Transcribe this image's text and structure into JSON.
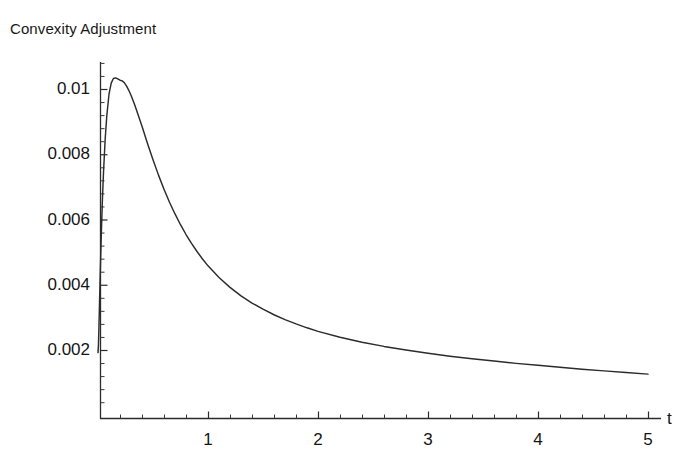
{
  "chart_data": {
    "type": "line",
    "title": "Convexity Adjustment",
    "xlabel": "t",
    "ylabel": "",
    "xlim": [
      0,
      5.1
    ],
    "ylim": [
      0,
      0.0109
    ],
    "grid": false,
    "legend": null,
    "x_ticks": [
      {
        "value": 1,
        "label": "1"
      },
      {
        "value": 2,
        "label": "2"
      },
      {
        "value": 3,
        "label": "3"
      },
      {
        "value": 4,
        "label": "4"
      },
      {
        "value": 5,
        "label": "5"
      }
    ],
    "y_ticks": [
      {
        "value": 0.002,
        "label": "0.002"
      },
      {
        "value": 0.004,
        "label": "0.004"
      },
      {
        "value": 0.006,
        "label": "0.006"
      },
      {
        "value": 0.008,
        "label": "0.008"
      },
      {
        "value": 0.01,
        "label": "0.01"
      }
    ],
    "x_minor_tick_step": 0.2,
    "y_minor_tick_step": 0.0004,
    "series": [
      {
        "name": "Convexity Adjustment",
        "color": "#2b2b2b",
        "x": [
          0.0,
          0.004,
          0.008,
          0.012,
          0.018,
          0.024,
          0.03,
          0.04,
          0.05,
          0.065,
          0.08,
          0.1,
          0.12,
          0.14,
          0.16,
          0.18,
          0.2,
          0.22,
          0.24,
          0.26,
          0.28,
          0.3,
          0.33,
          0.36,
          0.4,
          0.45,
          0.5,
          0.55,
          0.6,
          0.65,
          0.7,
          0.75,
          0.8,
          0.85,
          0.9,
          0.95,
          1.0,
          1.1,
          1.2,
          1.3,
          1.4,
          1.5,
          1.6,
          1.7,
          1.8,
          1.9,
          2.0,
          2.2,
          2.4,
          2.6,
          2.8,
          3.0,
          3.2,
          3.4,
          3.6,
          3.8,
          4.0,
          4.2,
          4.4,
          4.6,
          4.8,
          5.0
        ],
        "y": [
          0.00192,
          0.00215,
          0.00262,
          0.00318,
          0.00402,
          0.00482,
          0.00553,
          0.00659,
          0.00744,
          0.00845,
          0.00918,
          0.00984,
          0.01018,
          0.01032,
          0.01034,
          0.01031,
          0.01027,
          0.01025,
          0.01019,
          0.01009,
          0.00996,
          0.00981,
          0.00955,
          0.00926,
          0.00886,
          0.00833,
          0.00783,
          0.00736,
          0.00693,
          0.00653,
          0.00617,
          0.00584,
          0.00554,
          0.00527,
          0.00502,
          0.00479,
          0.00458,
          0.00422,
          0.00392,
          0.00366,
          0.00344,
          0.00325,
          0.00308,
          0.00293,
          0.0028,
          0.00268,
          0.00257,
          0.00239,
          0.00224,
          0.00211,
          0.002,
          0.0019,
          0.00181,
          0.00173,
          0.00166,
          0.00159,
          0.00153,
          0.00147,
          0.00141,
          0.00136,
          0.00131,
          0.00126
        ]
      }
    ]
  }
}
